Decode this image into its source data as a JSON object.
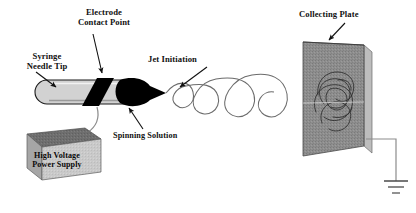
{
  "figure": {
    "title_visible": false,
    "background_color": "#ffffff",
    "width": 416,
    "height": 213
  },
  "labels": {
    "electrode_contact_point": "Electrode\nContact Point",
    "electrode_contact_point_line1": "Electrode",
    "electrode_contact_point_line2": "Contact Point",
    "syringe_needle_tip_line1": "Syringe",
    "syringe_needle_tip_line2": "Needle Tip",
    "jet_initiation": "Jet Initiation",
    "collecting_plate": "Collecting Plate",
    "spinning_solution": "Spinning Solution",
    "power_supply_line1": "High Voltage",
    "power_supply_line2": "Power Supply"
  },
  "components": {
    "syringe_needle": {
      "name": "syringe-needle-barrel",
      "fill": "#d2d2d2",
      "stroke": "#1a1a1a"
    },
    "electrode_band": {
      "name": "electrode-contact-band",
      "fill": "#000000"
    },
    "taylor_cone": {
      "name": "spinning-solution-droplet",
      "fill": "#000000"
    },
    "jet_spiral": {
      "name": "whipping-jet-spiral",
      "stroke": "#6b6b6b",
      "loops": 4
    },
    "collecting_plate": {
      "name": "collecting-plate",
      "face_fill": "#8a8a8a",
      "edge_fill": "#b8b8b8",
      "fiber_stroke": "#2b2b2b"
    },
    "power_supply": {
      "name": "high-voltage-power-supply",
      "top_fill": "#6e6e6e",
      "front_fill": "#c8c8c8",
      "side_fill": "#a0a0a0"
    },
    "ground_symbol": {
      "name": "earth-ground-symbol",
      "stroke": "#4a4a4a",
      "bars": 3
    },
    "hv_wire": {
      "name": "high-voltage-wire",
      "stroke": "#8c8c8c"
    },
    "ground_wire": {
      "name": "ground-wire",
      "stroke": "#8c8c8c"
    }
  },
  "annotations": {
    "arrows": [
      {
        "name": "arrow-to-electrode-contact-point",
        "from": "Electrode Contact Point",
        "to": "electrode band on needle"
      },
      {
        "name": "arrow-to-syringe-needle-tip",
        "from": "Syringe Needle Tip",
        "to": "needle tip"
      },
      {
        "name": "arrow-to-jet-initiation",
        "from": "Jet Initiation",
        "to": "jet start at droplet apex"
      },
      {
        "name": "arrow-to-collecting-plate",
        "from": "Collecting Plate",
        "to": "top of collecting plate"
      },
      {
        "name": "arrow-to-spinning-solution",
        "from": "Spinning Solution",
        "to": "droplet underside"
      }
    ]
  }
}
